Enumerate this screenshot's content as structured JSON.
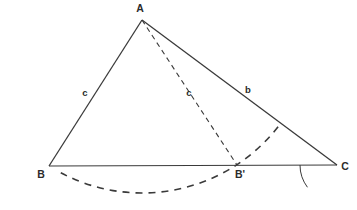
{
  "figure": {
    "background_color": "#ffffff",
    "stroke_color": "#3a3a3a",
    "label_color": "#2b2b2b",
    "width": 357,
    "height": 210
  },
  "points": {
    "A": {
      "label": "A",
      "x": 142,
      "y": 20,
      "label_x": 140,
      "label_y": 12
    },
    "B": {
      "label": "B",
      "x": 49,
      "y": 166,
      "label_x": 41,
      "label_y": 178
    },
    "B_prime": {
      "label": "B'",
      "x": 237,
      "y": 165,
      "label_x": 240,
      "label_y": 178
    },
    "C": {
      "label": "C",
      "x": 337,
      "y": 165,
      "label_x": 345,
      "label_y": 170
    }
  },
  "segments": {
    "side_c_solid": {
      "name": "A-B",
      "label": "c",
      "style": "solid",
      "label_x": 85,
      "label_y": 96,
      "x1": 142,
      "y1": 20,
      "x2": 49,
      "y2": 166
    },
    "side_b_solid": {
      "name": "A-C",
      "label": "b",
      "style": "solid",
      "label_x": 248,
      "label_y": 93,
      "x1": 142,
      "y1": 20,
      "x2": 337,
      "y2": 165
    },
    "side_c_dashed": {
      "name": "A-B'",
      "label": "c",
      "style": "dashed",
      "label_x": 189,
      "label_y": 96,
      "x1": 142,
      "y1": 20,
      "x2": 237,
      "y2": 165
    },
    "baseline": {
      "name": "B-C",
      "label": "",
      "style": "solid",
      "x1": 49,
      "y1": 166,
      "x2": 337,
      "y2": 165
    }
  },
  "arcs": {
    "construction_arc": {
      "name": "compass-arc-from-A",
      "style": "dashed",
      "center_x": 142,
      "center_y": 20,
      "radius": 173,
      "start_deg": 118,
      "end_deg": 37
    },
    "angle_marker_C": {
      "name": "angle-arc-at-C",
      "style": "solid",
      "center_x": 337,
      "center_y": 165,
      "radius": 37,
      "start_deg": 180,
      "end_deg": 143
    }
  },
  "labels": [
    {
      "key": "A",
      "text": "A"
    },
    {
      "key": "B",
      "text": "B"
    },
    {
      "key": "B_prime",
      "text": "B'"
    },
    {
      "key": "C",
      "text": "C"
    },
    {
      "key": "c_left",
      "text": "c"
    },
    {
      "key": "c_mid",
      "text": "c"
    },
    {
      "key": "b_right",
      "text": "b"
    }
  ]
}
